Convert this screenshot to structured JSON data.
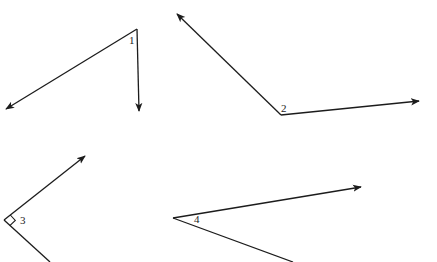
{
  "figure": {
    "width": 437,
    "height": 262,
    "background": "#ffffff",
    "line_color": "#1c1c1c",
    "angles": [
      {
        "label": "1",
        "vertex": [
          137,
          29
        ],
        "rays": [
          [
            6,
            109
          ],
          [
            139,
            111
          ]
        ],
        "arrowheads": [
          true,
          true
        ],
        "label_pos": [
          129,
          44
        ],
        "right_angle_marker": false
      },
      {
        "label": "2",
        "vertex": [
          281,
          115
        ],
        "rays": [
          [
            177,
            14
          ],
          [
            419,
            101
          ]
        ],
        "arrowheads": [
          true,
          true
        ],
        "label_pos": [
          281,
          112
        ],
        "right_angle_marker": false
      },
      {
        "label": "3",
        "vertex": [
          4,
          220
        ],
        "rays": [
          [
            85,
            156
          ],
          [
            50,
            262
          ]
        ],
        "arrowheads": [
          true,
          false
        ],
        "label_pos": [
          20,
          224
        ],
        "right_angle_marker": true
      },
      {
        "label": "4",
        "vertex": [
          173,
          218
        ],
        "rays": [
          [
            361,
            187
          ],
          [
            293,
            262
          ]
        ],
        "arrowheads": [
          true,
          false
        ],
        "label_pos": [
          194,
          223
        ],
        "right_angle_marker": false
      }
    ]
  }
}
